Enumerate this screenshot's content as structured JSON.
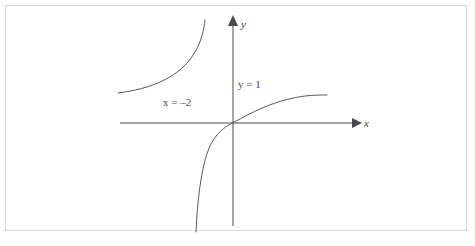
{
  "figure": {
    "kind": "coordinate-plane-graph",
    "background_color": "#ffffff",
    "frame_color": "#d8d8d8",
    "axis_color": "#4a4a4a",
    "curve_color": "#5a5a5a"
  },
  "axes": {
    "x_axis_label": "x",
    "y_axis_label": "y",
    "origin": {
      "x": 233,
      "y": 123
    },
    "x_axis_start_px": 120,
    "x_axis_end_px": 360,
    "y_axis_top_px": 18,
    "y_axis_bottom_px": 226,
    "ticks": [],
    "gridlines": false
  },
  "annotations": [
    {
      "id": "x-asymptote",
      "variable": "x",
      "relation": "=",
      "value": "–2",
      "full_text": "x = –2",
      "meaning": "vertical asymptote"
    },
    {
      "id": "y-asymptote",
      "variable": "y",
      "relation": "=",
      "value": "1",
      "full_text": "y = 1",
      "meaning": "horizontal asymptote"
    }
  ],
  "chart_data": {
    "type": "line",
    "title": "",
    "subtitle": "",
    "xlabel": "x",
    "ylabel": "y",
    "xlim": [
      -6.5,
      4.5
    ],
    "ylim": [
      -4.5,
      3.5
    ],
    "grid": false,
    "legend": "none",
    "asymptotes": [
      {
        "kind": "vertical",
        "value": -2,
        "label": "x = –2",
        "drawn": false
      },
      {
        "kind": "horizontal",
        "value": 1,
        "label": "y = 1",
        "drawn": false
      }
    ],
    "series": [
      {
        "name": "left-upper-branch",
        "description": "branch above y = 1 and left of x = –2, rising steeply toward the vertical asymptote",
        "path": "M 118 93 C 150 89, 180 78, 195 52 C 201 42, 204 30, 205 20"
      },
      {
        "name": "right-lower-branch",
        "description": "branch through the origin, falling steeply toward the vertical asymptote from the right and flattening toward y = 1",
        "path": "M 196 232 C 198 190, 203 155, 214 139 C 222 127, 231 124, 240 119 C 258 109, 280 99, 305 96 C 313 95, 321 95, 327 95"
      }
    ]
  }
}
